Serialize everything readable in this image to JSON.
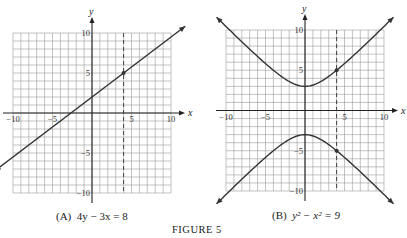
{
  "figure_label": "FIGURE 5",
  "panels": [
    {
      "id": "A",
      "caption_prefix": "(A)",
      "caption_eq": "4y − 3x = 8",
      "x_axis_label": "x",
      "y_axis_label": "y",
      "x_ticks": [
        "−10",
        "−5",
        "5",
        "10"
      ],
      "y_ticks": [
        "10",
        "5",
        "−5",
        "−10"
      ],
      "dashed_line_x": 4,
      "highlight_points": [
        [
          4,
          5
        ]
      ]
    },
    {
      "id": "B",
      "caption_prefix": "(B)",
      "caption_eq": "y² − x² = 9",
      "x_axis_label": "x",
      "y_axis_label": "y",
      "x_ticks": [
        "−10",
        "−5",
        "5",
        "10"
      ],
      "y_ticks": [
        "10",
        "5",
        "−5",
        "−10"
      ],
      "dashed_line_x": 4,
      "highlight_points": [
        [
          4,
          5
        ],
        [
          4,
          -5
        ]
      ]
    }
  ],
  "chart_data": [
    {
      "type": "line",
      "title": "(A) 4y − 3x = 8",
      "equation": "4y - 3x = 8",
      "xlabel": "x",
      "ylabel": "y",
      "xlim": [
        -10,
        10
      ],
      "ylim": [
        -10,
        10
      ],
      "grid": true,
      "grid_step": 1,
      "series": [
        {
          "name": "y = (3x + 8)/4",
          "x": [
            -10,
            -5,
            0,
            4,
            5,
            10
          ],
          "y": [
            -5.5,
            -1.75,
            2,
            5,
            5.75,
            9.5
          ]
        }
      ],
      "annotations": [
        {
          "type": "vline",
          "x": 4,
          "style": "dashed"
        },
        {
          "type": "point",
          "x": 4,
          "y": 5
        }
      ]
    },
    {
      "type": "line",
      "title": "(B) y² − x² = 9",
      "equation": "y^2 - x^2 = 9",
      "xlabel": "x",
      "ylabel": "y",
      "xlim": [
        -10,
        10
      ],
      "ylim": [
        -10,
        10
      ],
      "grid": true,
      "grid_step": 1,
      "series": [
        {
          "name": "upper branch y = sqrt(9 + x^2)",
          "x": [
            -10,
            -5,
            0,
            4,
            5,
            10
          ],
          "y": [
            10.44,
            5.83,
            3,
            5,
            5.83,
            10.44
          ]
        },
        {
          "name": "lower branch y = -sqrt(9 + x^2)",
          "x": [
            -10,
            -5,
            0,
            4,
            5,
            10
          ],
          "y": [
            -10.44,
            -5.83,
            -3,
            -5,
            -5.83,
            -10.44
          ]
        }
      ],
      "annotations": [
        {
          "type": "vline",
          "x": 4,
          "style": "dashed"
        },
        {
          "type": "point",
          "x": 4,
          "y": 5
        },
        {
          "type": "point",
          "x": 4,
          "y": -5
        }
      ]
    }
  ]
}
